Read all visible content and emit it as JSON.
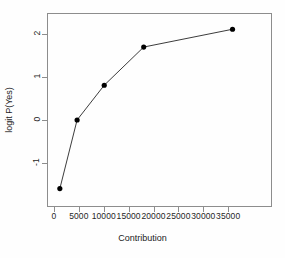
{
  "chart_data": {
    "type": "line",
    "title": "",
    "subtitle": "",
    "xlabel": "Contribution",
    "ylabel": "logit P(Yes)",
    "x": [
      1000,
      4500,
      10000,
      18000,
      36000
    ],
    "values": [
      -1.62,
      0.0,
      0.82,
      1.72,
      2.14
    ],
    "series": [
      {
        "name": "logit P(Yes)",
        "x": [
          1000,
          4500,
          10000,
          18000,
          36000
        ],
        "values": [
          -1.62,
          0.0,
          0.82,
          1.72,
          2.14
        ]
      }
    ],
    "xticks": [
      0,
      5000,
      10000,
      15000,
      20000,
      25000,
      30000,
      35000
    ],
    "xticklabels": [
      "0",
      "5000",
      "10000",
      "15000",
      "20000",
      "25000",
      "30000",
      "35000"
    ],
    "yticks": [
      -1,
      0,
      1,
      2
    ],
    "yticklabels": [
      "-1",
      "0",
      "1",
      "2"
    ],
    "xlim": [
      -1400,
      43800
    ],
    "ylim": [
      -2.03,
      2.5
    ],
    "grid": false,
    "legend": false,
    "marker": "filled-circle",
    "line_color": "#3a3a3a",
    "marker_color": "#000000",
    "frame_color": "#8d8d8d",
    "background": "#ffffff"
  }
}
